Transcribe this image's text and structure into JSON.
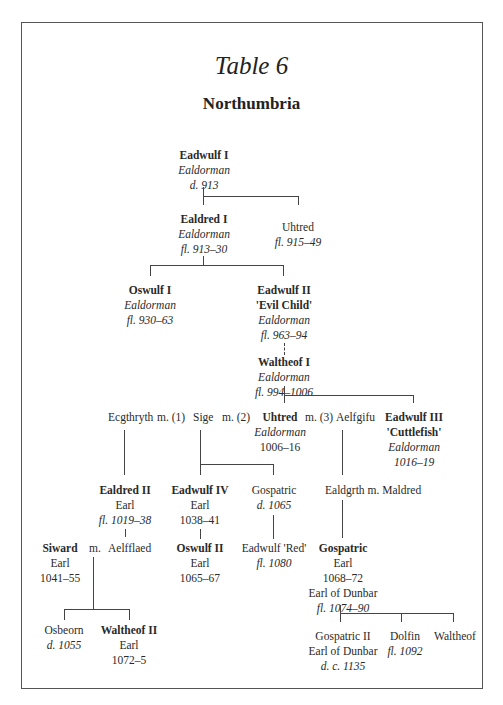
{
  "title": "Table 6",
  "subtitle": "Northumbria",
  "nodes": {
    "eadwulf1": {
      "name": "Eadwulf I",
      "role": "Ealdorman",
      "dates": "d. 913"
    },
    "ealdred1": {
      "name": "Ealdred I",
      "role": "Ealdorman",
      "dates": "fl. 913–30"
    },
    "uhtred_a": {
      "name": "Uhtred",
      "dates": "fl. 915–49"
    },
    "oswulf1": {
      "name": "Oswulf I",
      "role": "Ealdorman",
      "dates": "fl. 930–63"
    },
    "eadwulf2": {
      "name": "Eadwulf II",
      "epithet": "'Evil Child'",
      "role": "Ealdorman",
      "dates": "fl. 963–94"
    },
    "waltheof1": {
      "name": "Waltheof I",
      "role": "Ealdorman",
      "dates": "fl. 994–1006"
    },
    "ecgthryth": {
      "name": "Ecgthryth",
      "marriage": "m. (1)"
    },
    "sige": {
      "name": "Sige",
      "marriage": "m. (2)"
    },
    "uhtred_b": {
      "name": "Uhtred",
      "marriage": "m. (3)",
      "spouse": "Aelfgifu",
      "role": "Ealdorman",
      "dates": "1006–16"
    },
    "eadwulf3": {
      "name": "Eadwulf III",
      "epithet": "'Cuttlefish'",
      "role": "Ealdorman",
      "dates": "1016–19"
    },
    "ealdred2": {
      "name": "Ealdred II",
      "role": "Earl",
      "dates": "fl. 1019–38"
    },
    "eadwulf4": {
      "name": "Eadwulf IV",
      "role": "Earl",
      "dates": "1038–41"
    },
    "gospatric_a": {
      "name": "Gospatric",
      "dates": "d. 1065"
    },
    "ealdgrth": {
      "text": "Ealdgrth m. Maldred"
    },
    "siward": {
      "name": "Siward",
      "marriage": "m.",
      "spouse": "Aelfflaed",
      "role": "Earl",
      "dates": "1041–55"
    },
    "oswulf2": {
      "name": "Oswulf II",
      "role": "Earl",
      "dates": "1065–67"
    },
    "eadwulf_red": {
      "name": "Eadwulf 'Red'",
      "dates": "fl. 1080"
    },
    "gospatric_b": {
      "name": "Gospatric",
      "role": "Earl",
      "dates": "1068–72",
      "role2": "Earl of Dunbar",
      "dates2": "fl. 1074–90"
    },
    "osbeorn": {
      "name": "Osbeorn",
      "dates": "d. 1055"
    },
    "waltheof2": {
      "name": "Waltheof II",
      "role": "Earl",
      "dates": "1072–5"
    },
    "gospatric2": {
      "name": "Gospatric II",
      "role": "Earl of Dunbar",
      "dates": "d. c. 1135"
    },
    "dolfin": {
      "name": "Dolfin",
      "dates": "fl. 1092"
    },
    "waltheof_c": {
      "name": "Waltheof"
    }
  }
}
